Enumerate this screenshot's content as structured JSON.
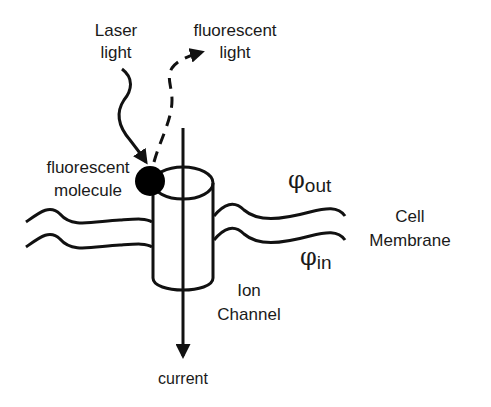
{
  "diagram": {
    "labels": {
      "laser_line1": "Laser",
      "laser_line2": "light",
      "fluor_light_line1": "fluorescent",
      "fluor_light_line2": "light",
      "molecule_line1": "fluorescent",
      "molecule_line2": "molecule",
      "phi_out_symbol": "φ",
      "phi_out_sub": "out",
      "phi_in_symbol": "φ",
      "phi_in_sub": "in",
      "membrane_line1": "Cell",
      "membrane_line2": "Membrane",
      "channel_line1": "Ion",
      "channel_line2": "Channel",
      "current": "current"
    },
    "colors": {
      "stroke": "#111111",
      "background": "#ffffff",
      "text": "#1a1a1a"
    }
  }
}
